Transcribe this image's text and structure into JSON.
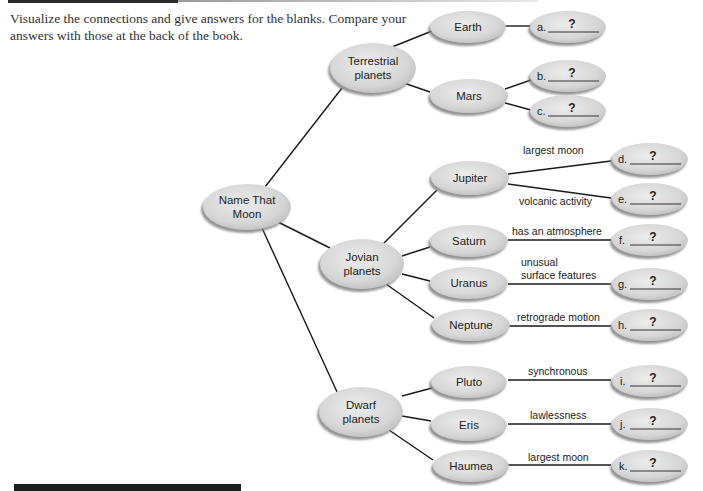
{
  "instructions": {
    "line1": "Visualize the connections and give answers for the blanks. Compare your",
    "line2": "answers with those at the back of the book."
  },
  "root": {
    "label_line1": "Name That",
    "label_line2": "Moon"
  },
  "categories": [
    {
      "id": "terrestrial",
      "label_line1": "Terrestrial",
      "label_line2": "planets"
    },
    {
      "id": "jovian",
      "label_line1": "Jovian",
      "label_line2": "planets"
    },
    {
      "id": "dwarf",
      "label_line1": "Dwarf",
      "label_line2": "planets"
    }
  ],
  "planets": [
    {
      "id": "earth",
      "label": "Earth",
      "category": "terrestrial"
    },
    {
      "id": "mars",
      "label": "Mars",
      "category": "terrestrial"
    },
    {
      "id": "jupiter",
      "label": "Jupiter",
      "category": "jovian"
    },
    {
      "id": "saturn",
      "label": "Saturn",
      "category": "jovian"
    },
    {
      "id": "uranus",
      "label": "Uranus",
      "category": "jovian"
    },
    {
      "id": "neptune",
      "label": "Neptune",
      "category": "jovian"
    },
    {
      "id": "pluto",
      "label": "Pluto",
      "category": "dwarf"
    },
    {
      "id": "eris",
      "label": "Eris",
      "category": "dwarf"
    },
    {
      "id": "haumea",
      "label": "Haumea",
      "category": "dwarf"
    }
  ],
  "blanks": [
    {
      "letter": "a.",
      "answer": "?",
      "planet": "earth",
      "hint": ""
    },
    {
      "letter": "b.",
      "answer": "?",
      "planet": "mars",
      "hint": ""
    },
    {
      "letter": "c.",
      "answer": "?",
      "planet": "mars",
      "hint": ""
    },
    {
      "letter": "d.",
      "answer": "?",
      "planet": "jupiter",
      "hint": "largest moon"
    },
    {
      "letter": "e.",
      "answer": "?",
      "planet": "jupiter",
      "hint": "volcanic activity"
    },
    {
      "letter": "f.",
      "answer": "?",
      "planet": "saturn",
      "hint": "has an atmosphere"
    },
    {
      "letter": "g.",
      "answer": "?",
      "planet": "uranus",
      "hint_line1": "unusual",
      "hint_line2": "surface features"
    },
    {
      "letter": "h.",
      "answer": "?",
      "planet": "neptune",
      "hint": "retrograde motion"
    },
    {
      "letter": "i.",
      "answer": "?",
      "planet": "pluto",
      "hint": "synchronous"
    },
    {
      "letter": "j.",
      "answer": "?",
      "planet": "eris",
      "hint": "lawlessness"
    },
    {
      "letter": "k.",
      "answer": "?",
      "planet": "haumea",
      "hint": "largest moon"
    }
  ],
  "colors": {
    "node_fill": "#d9d9d9",
    "node_shadow": "#8c8c8c",
    "line": "#1a1a1a",
    "text": "#222222"
  }
}
